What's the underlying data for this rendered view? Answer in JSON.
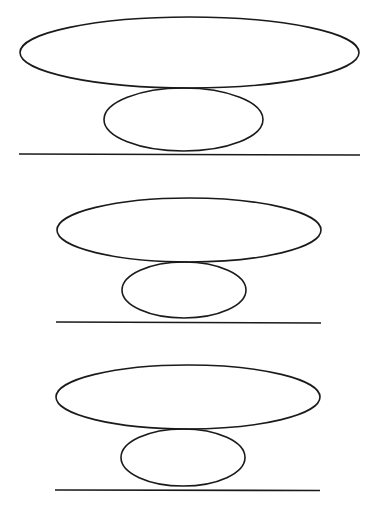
{
  "canvas": {
    "width": 379,
    "height": 518,
    "background": "#ffffff",
    "stroke": "#1a1a1a"
  },
  "figures": [
    {
      "name": "figure-1",
      "large_ellipse": {
        "cx": 189.5,
        "cy": 52.5,
        "rx": 169.5,
        "ry": 35.5
      },
      "small_ellipse": {
        "cx": 183.5,
        "cy": 119.5,
        "rx": 79.5,
        "ry": 31.5
      },
      "ground_line": {
        "x1": 19,
        "y1": 154,
        "x2": 360,
        "y2": 155
      }
    },
    {
      "name": "figure-2",
      "large_ellipse": {
        "cx": 189,
        "cy": 230,
        "rx": 132,
        "ry": 32
      },
      "small_ellipse": {
        "cx": 184,
        "cy": 290,
        "rx": 62,
        "ry": 28
      },
      "ground_line": {
        "x1": 56,
        "y1": 322,
        "x2": 321,
        "y2": 323
      }
    },
    {
      "name": "figure-3",
      "large_ellipse": {
        "cx": 188,
        "cy": 397,
        "rx": 132,
        "ry": 32
      },
      "small_ellipse": {
        "cx": 183,
        "cy": 457.5,
        "rx": 62,
        "ry": 28.5
      },
      "ground_line": {
        "x1": 55,
        "y1": 490,
        "x2": 320,
        "y2": 490.5
      }
    }
  ]
}
